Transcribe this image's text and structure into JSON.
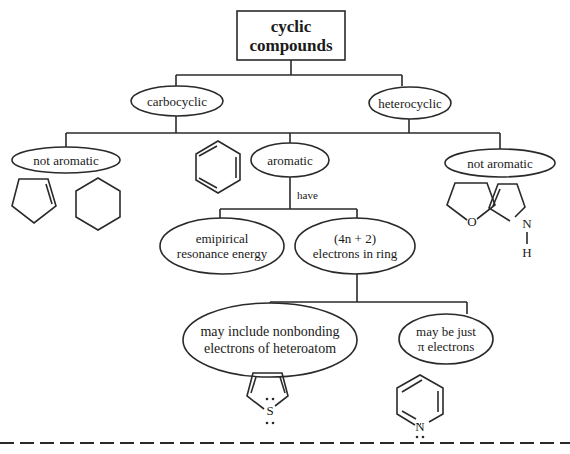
{
  "title": {
    "line1": "cyclic",
    "line2": "compounds"
  },
  "level1": [
    {
      "id": "carbocyclic",
      "label": "carbocyclic"
    },
    {
      "id": "heterocyclic",
      "label": "heterocyclic"
    }
  ],
  "level2": {
    "not_aromatic_left": "not aromatic",
    "aromatic": "aromatic",
    "not_aromatic_right": "not aromatic"
  },
  "edge_label_have": "have",
  "level3": {
    "empirical": {
      "line1": "emipirical",
      "line2": "resonance energy"
    },
    "huckel": {
      "line1": "(4n + 2)",
      "line2": "electrons in ring"
    }
  },
  "level4": {
    "nonbonding": {
      "line1": "may include nonbonding",
      "line2": "electrons of heteroatom"
    },
    "pi_only": {
      "line1": "may be just",
      "line2": "π electrons"
    }
  },
  "molecules": {
    "cyclopentene": "cyclopentene",
    "cyclohexane": "cyclohexane",
    "benzene": "benzene",
    "tetrahydrofuran": {
      "atom": "O"
    },
    "pyrroline": {
      "atom": "N",
      "h": "H"
    },
    "thiophene": {
      "atom": "S"
    },
    "pyridine": {
      "atom": "N"
    }
  },
  "colors": {
    "line": "#2a2a2a",
    "background": "#ffffff"
  }
}
